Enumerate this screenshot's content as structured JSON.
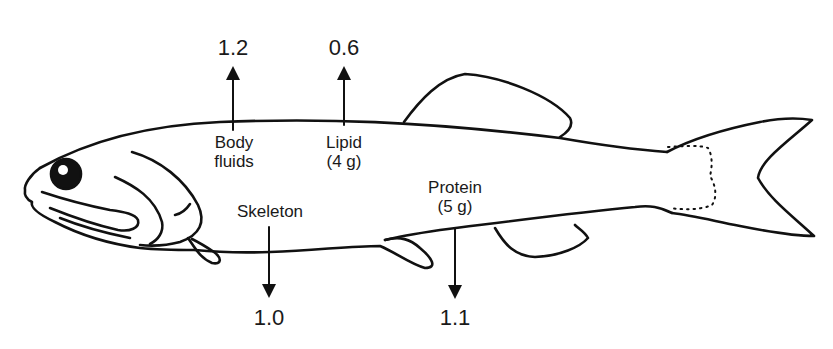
{
  "diagram": {
    "components": [
      {
        "id": "body_fluids",
        "label_line1": "Body",
        "label_line2": "fluids",
        "value": "1.2",
        "arrow_direction": "up"
      },
      {
        "id": "lipid",
        "label_line1": "Lipid",
        "label_line2": "(4 g)",
        "value": "0.6",
        "arrow_direction": "up"
      },
      {
        "id": "skeleton",
        "label_line1": "Skeleton",
        "label_line2": "",
        "value": "1.0",
        "arrow_direction": "down"
      },
      {
        "id": "protein",
        "label_line1": "Protein",
        "label_line2": "(5 g)",
        "value": "1.1",
        "arrow_direction": "down"
      }
    ],
    "colors": {
      "line": "#111111",
      "background": "#ffffff"
    }
  }
}
